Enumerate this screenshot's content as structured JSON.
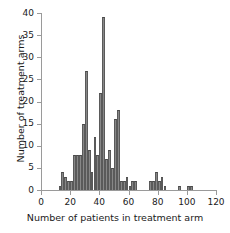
{
  "chart_data": {
    "type": "bar",
    "title": "",
    "subtitle": "",
    "xlabel": "Number of patients in treatment arm",
    "ylabel": "Number of treatment arms",
    "xlim": [
      0,
      120
    ],
    "ylim": [
      0,
      40
    ],
    "xticks": [
      0,
      20,
      40,
      60,
      80,
      100,
      120
    ],
    "yticks": [
      0,
      5,
      10,
      15,
      20,
      25,
      30,
      35,
      40
    ],
    "grid": false,
    "legend": null,
    "bin_width": 2,
    "bar_color": "#878787",
    "edge_color": "#4a4a4a",
    "axis_color": "#9a9a9a",
    "text_color": "#1a1a1a",
    "categories": [
      12,
      14,
      16,
      18,
      20,
      22,
      24,
      26,
      28,
      30,
      32,
      34,
      36,
      38,
      40,
      42,
      44,
      46,
      48,
      50,
      52,
      54,
      56,
      58,
      60,
      62,
      64,
      66,
      74,
      76,
      78,
      80,
      82,
      94,
      96,
      100,
      102
    ],
    "values": [
      1,
      4,
      3,
      2,
      2,
      8,
      8,
      8,
      15,
      27,
      9,
      4,
      12,
      8,
      22,
      39,
      7,
      9,
      5,
      16,
      18,
      2,
      2,
      3,
      1,
      2,
      2,
      0,
      2,
      2,
      4,
      2,
      3,
      1,
      1,
      1,
      1
    ],
    "bars": [
      {
        "x": 12,
        "value": 1
      },
      {
        "x": 14,
        "value": 4
      },
      {
        "x": 16,
        "value": 3
      },
      {
        "x": 18,
        "value": 2
      },
      {
        "x": 20,
        "value": 2
      },
      {
        "x": 22,
        "value": 8
      },
      {
        "x": 24,
        "value": 8
      },
      {
        "x": 26,
        "value": 8
      },
      {
        "x": 28,
        "value": 15
      },
      {
        "x": 30,
        "value": 27
      },
      {
        "x": 32,
        "value": 9
      },
      {
        "x": 34,
        "value": 4
      },
      {
        "x": 36,
        "value": 12
      },
      {
        "x": 38,
        "value": 8
      },
      {
        "x": 40,
        "value": 22
      },
      {
        "x": 42,
        "value": 39
      },
      {
        "x": 44,
        "value": 7
      },
      {
        "x": 46,
        "value": 9
      },
      {
        "x": 48,
        "value": 5
      },
      {
        "x": 50,
        "value": 16
      },
      {
        "x": 52,
        "value": 18
      },
      {
        "x": 54,
        "value": 2
      },
      {
        "x": 56,
        "value": 2
      },
      {
        "x": 58,
        "value": 3
      },
      {
        "x": 60,
        "value": 1
      },
      {
        "x": 62,
        "value": 2
      },
      {
        "x": 64,
        "value": 2
      },
      {
        "x": 74,
        "value": 2
      },
      {
        "x": 76,
        "value": 2
      },
      {
        "x": 78,
        "value": 4
      },
      {
        "x": 80,
        "value": 2
      },
      {
        "x": 82,
        "value": 3
      },
      {
        "x": 84,
        "value": 1
      },
      {
        "x": 94,
        "value": 1
      },
      {
        "x": 100,
        "value": 1
      },
      {
        "x": 102,
        "value": 1
      }
    ]
  }
}
